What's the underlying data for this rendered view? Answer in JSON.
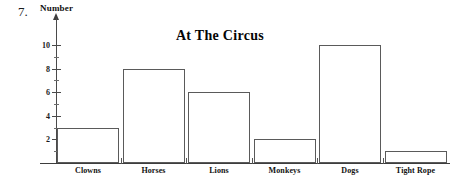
{
  "question_number": "7.",
  "chart_data": {
    "type": "bar",
    "title": "At The Circus",
    "xlabel": "",
    "ylabel": "Number",
    "ylim": [
      0,
      11
    ],
    "grid": false,
    "legend": "none",
    "categories": [
      "Clowns",
      "Horses",
      "Lions",
      "Monkeys",
      "Dogs",
      "Tight Rope"
    ],
    "values": [
      3,
      8,
      6,
      2,
      10,
      1
    ],
    "y_tick_labels": [
      "2",
      "4",
      "6",
      "8",
      "10"
    ],
    "y_tick_values": [
      2,
      4,
      6,
      8,
      10
    ],
    "y_minor_tick_values": [
      1,
      3,
      5,
      7,
      9
    ],
    "bar_fill_color": "#ffffff",
    "bar_border_color": "#5a5a5a",
    "axis_color": "#3d3d3d",
    "text_color": "#111111"
  }
}
